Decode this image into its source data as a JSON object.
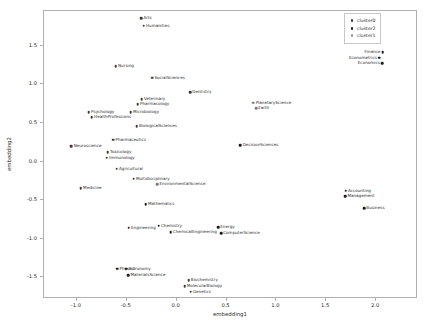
{
  "chart_data": {
    "type": "scatter",
    "title": "",
    "xlabel": "embedding1",
    "ylabel": "embedding2",
    "xlim": [
      -1.33,
      2.42
    ],
    "ylim": [
      -1.78,
      1.95
    ],
    "xticks": [
      "-1.0",
      "-0.5",
      "0.0",
      "0.5",
      "1.0",
      "1.5",
      "2.0"
    ],
    "xtick_values": [
      -1.0,
      -0.5,
      0.0,
      0.5,
      1.0,
      1.5,
      2.0
    ],
    "yticks": [
      "1.5",
      "1.0",
      "0.5",
      "0.0",
      "-0.5",
      "-1.0",
      "-1.5"
    ],
    "ytick_values": [
      1.5,
      1.0,
      0.5,
      0.0,
      -0.5,
      -1.0,
      -1.5
    ],
    "grid": false,
    "legend_position": "upper right",
    "legend": [
      {
        "label": "cluster0",
        "color": "#3a3a3a"
      },
      {
        "label": "cluster2",
        "color": "#1c1c1c"
      },
      {
        "label": "cluster1",
        "color": "#9a9a9a"
      }
    ],
    "points": [
      {
        "label": "Arts",
        "x": -0.355,
        "y": 1.855,
        "cluster": "cluster0",
        "anchor": "right"
      },
      {
        "label": "Humanities",
        "x": -0.33,
        "y": 1.76,
        "cluster": "cluster0",
        "anchor": "right"
      },
      {
        "label": "Nursing",
        "x": -0.61,
        "y": 1.235,
        "cluster": "cluster0",
        "anchor": "right"
      },
      {
        "label": "SocialSciences",
        "x": -0.245,
        "y": 1.085,
        "cluster": "cluster0",
        "anchor": "right"
      },
      {
        "label": "Dentistry",
        "x": 0.135,
        "y": 0.9,
        "cluster": "cluster0",
        "anchor": "right"
      },
      {
        "label": "Veterinary",
        "x": -0.35,
        "y": 0.81,
        "cluster": "cluster0",
        "anchor": "right"
      },
      {
        "label": "Pharmacology",
        "x": -0.39,
        "y": 0.745,
        "cluster": "cluster0",
        "anchor": "right"
      },
      {
        "label": "Psychology",
        "x": -0.88,
        "y": 0.64,
        "cluster": "cluster0",
        "anchor": "right"
      },
      {
        "label": "Microbiology",
        "x": -0.46,
        "y": 0.64,
        "cluster": "cluster0",
        "anchor": "right"
      },
      {
        "label": "HealthProfessions",
        "x": -0.85,
        "y": 0.575,
        "cluster": "cluster0",
        "anchor": "right"
      },
      {
        "label": "PlanetaryScience",
        "x": 0.77,
        "y": 0.76,
        "cluster": "cluster1",
        "anchor": "right"
      },
      {
        "label": "Earth",
        "x": 0.795,
        "y": 0.69,
        "cluster": "cluster1",
        "anchor": "right"
      },
      {
        "label": "BiologicalSciences",
        "x": -0.4,
        "y": 0.455,
        "cluster": "cluster0",
        "anchor": "right"
      },
      {
        "label": "Pharmaceutics",
        "x": -0.635,
        "y": 0.285,
        "cluster": "cluster0",
        "anchor": "right"
      },
      {
        "label": "Neuroscience",
        "x": -1.055,
        "y": 0.2,
        "cluster": "cluster0",
        "anchor": "right"
      },
      {
        "label": "Toxicology",
        "x": -0.69,
        "y": 0.12,
        "cluster": "cluster0",
        "anchor": "right"
      },
      {
        "label": "Immunology",
        "x": -0.7,
        "y": 0.05,
        "cluster": "cluster0",
        "anchor": "right"
      },
      {
        "label": "DecisionSciences",
        "x": 0.64,
        "y": 0.215,
        "cluster": "cluster2",
        "anchor": "right"
      },
      {
        "label": "Agricultural",
        "x": -0.6,
        "y": -0.095,
        "cluster": "cluster0",
        "anchor": "right"
      },
      {
        "label": "Multidisciplinary",
        "x": -0.43,
        "y": -0.22,
        "cluster": "cluster0",
        "anchor": "right"
      },
      {
        "label": "EnvironmentalScience",
        "x": -0.195,
        "y": -0.295,
        "cluster": "cluster1",
        "anchor": "right"
      },
      {
        "label": "Medicine",
        "x": -0.96,
        "y": -0.345,
        "cluster": "cluster0",
        "anchor": "right"
      },
      {
        "label": "Mathematics",
        "x": -0.31,
        "y": -0.555,
        "cluster": "cluster2",
        "anchor": "right"
      },
      {
        "label": "Accounting",
        "x": 1.695,
        "y": -0.38,
        "cluster": "cluster2",
        "anchor": "right"
      },
      {
        "label": "Management",
        "x": 1.69,
        "y": -0.45,
        "cluster": "cluster2",
        "anchor": "right"
      },
      {
        "label": "Business",
        "x": 1.88,
        "y": -0.605,
        "cluster": "cluster2",
        "anchor": "right"
      },
      {
        "label": "Engineering",
        "x": -0.48,
        "y": -0.855,
        "cluster": "cluster2",
        "anchor": "right"
      },
      {
        "label": "Chemistry",
        "x": -0.18,
        "y": -0.83,
        "cluster": "cluster2",
        "anchor": "right"
      },
      {
        "label": "ChemicalEngineering",
        "x": -0.06,
        "y": -0.915,
        "cluster": "cluster2",
        "anchor": "right"
      },
      {
        "label": "Energy",
        "x": 0.415,
        "y": -0.85,
        "cluster": "cluster2",
        "anchor": "right"
      },
      {
        "label": "ComputerScience",
        "x": 0.445,
        "y": -0.925,
        "cluster": "cluster2",
        "anchor": "right"
      },
      {
        "label": "Physics",
        "x": -0.595,
        "y": -1.385,
        "cluster": "cluster2",
        "anchor": "right"
      },
      {
        "label": "Astronomy",
        "x": -0.505,
        "y": -1.385,
        "cluster": "cluster2",
        "anchor": "right"
      },
      {
        "label": "MaterialsScience",
        "x": -0.485,
        "y": -1.47,
        "cluster": "cluster2",
        "anchor": "right"
      },
      {
        "label": "Biochemistry",
        "x": 0.12,
        "y": -1.54,
        "cluster": "cluster0",
        "anchor": "right"
      },
      {
        "label": "MolecularBiology",
        "x": 0.08,
        "y": -1.615,
        "cluster": "cluster0",
        "anchor": "right"
      },
      {
        "label": "Genetics",
        "x": 0.14,
        "y": -1.685,
        "cluster": "cluster0",
        "anchor": "right"
      },
      {
        "label": "Finance",
        "x": 2.065,
        "y": 1.42,
        "cluster": "cluster2",
        "anchor": "left"
      },
      {
        "label": "Econometrics",
        "x": 2.03,
        "y": 1.345,
        "cluster": "cluster2",
        "anchor": "left"
      },
      {
        "label": "Economics",
        "x": 2.06,
        "y": 1.275,
        "cluster": "cluster2",
        "anchor": "left"
      }
    ]
  }
}
